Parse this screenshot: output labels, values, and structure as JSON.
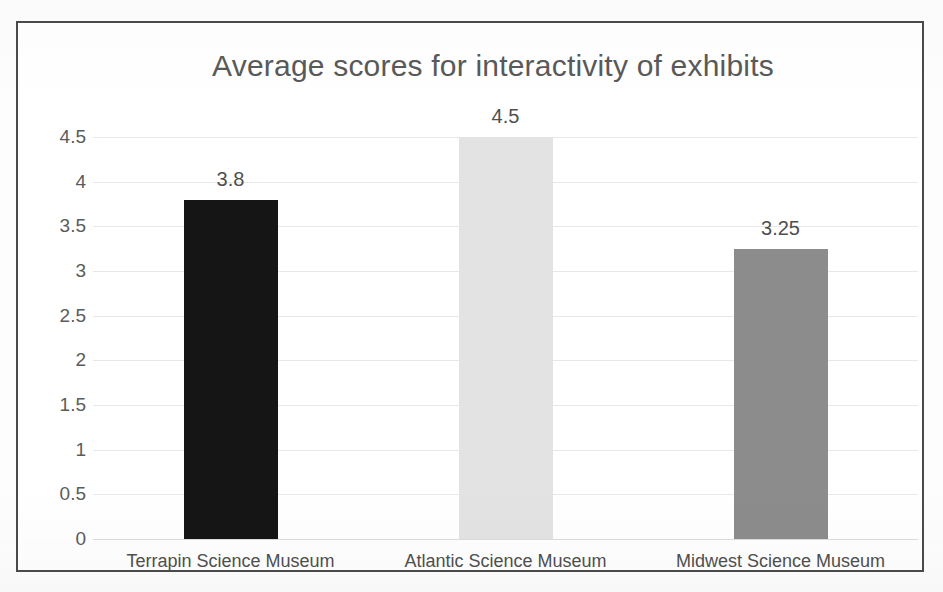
{
  "chart_data": {
    "type": "bar",
    "title": "Average scores for interactivity of exhibits",
    "xlabel": "",
    "ylabel": "",
    "categories": [
      "Terrapin Science Museum",
      "Atlantic Science Museum",
      "Midwest Science Museum"
    ],
    "values": [
      3.8,
      4.5,
      3.25
    ],
    "data_labels": [
      "3.8",
      "4.5",
      "3.25"
    ],
    "ylim": [
      0,
      4.5
    ],
    "yticks": [
      4.5,
      4,
      3.5,
      3,
      2.5,
      2,
      1.5,
      1,
      0.5,
      0
    ],
    "ytick_labels": [
      "4.5",
      "4",
      "3.5",
      "3",
      "2.5",
      "2",
      "1.5",
      "1",
      "0.5",
      "0"
    ],
    "grid": true,
    "legend": false,
    "bar_colors": [
      "#151515",
      "#e3e3e3",
      "#8c8c8c"
    ]
  },
  "style": {
    "title_color": "#595959",
    "tick_color": "#5b5b5b",
    "gridline_color": "#e8e8e8",
    "frame_color": "#4a4a4a",
    "background": "#ffffff"
  }
}
